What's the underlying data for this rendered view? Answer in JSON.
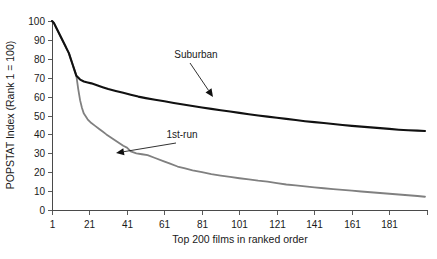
{
  "chart_data": {
    "type": "line",
    "title": "",
    "xlabel": "Top 200 films in ranked order",
    "ylabel": "POPSTAT Index (Rank 1 = 100)",
    "xlim": [
      1,
      200
    ],
    "ylim": [
      0,
      100
    ],
    "grid": false,
    "legend_position": "inline-annotations",
    "xticks": [
      1,
      21,
      41,
      61,
      81,
      101,
      121,
      141,
      161,
      181
    ],
    "xtick_labels": [
      "1",
      "21",
      "41",
      "61",
      "81",
      "101",
      "121",
      "141",
      "161",
      "181"
    ],
    "yticks": [
      0,
      10,
      20,
      30,
      40,
      50,
      60,
      70,
      80,
      90,
      100
    ],
    "ytick_labels": [
      "0",
      "10",
      "20",
      "30",
      "40",
      "50",
      "60",
      "70",
      "80",
      "90",
      "100"
    ],
    "series": [
      {
        "name": "Suburban",
        "color": "#111111",
        "width": 2.1,
        "x": [
          1,
          2,
          3,
          4,
          5,
          6,
          7,
          8,
          9,
          10,
          11,
          12,
          13,
          14,
          16,
          18,
          20,
          22,
          25,
          28,
          31,
          35,
          39,
          43,
          47,
          51,
          56,
          61,
          66,
          71,
          76,
          81,
          86,
          91,
          96,
          101,
          106,
          111,
          116,
          121,
          126,
          131,
          136,
          141,
          146,
          151,
          156,
          161,
          166,
          171,
          176,
          181,
          186,
          191,
          196,
          200
        ],
        "values": [
          100,
          99,
          97,
          95,
          93,
          91,
          89,
          87,
          85,
          83,
          80,
          77,
          74,
          71,
          69,
          68,
          67.5,
          67,
          66,
          65,
          64,
          63,
          62,
          61,
          60,
          59.2,
          58.3,
          57.5,
          56.6,
          55.8,
          55,
          54.2,
          53.5,
          52.8,
          52.1,
          51.4,
          50.7,
          50,
          49.4,
          48.8,
          48.2,
          47.6,
          47,
          46.5,
          46,
          45.5,
          45,
          44.5,
          44.1,
          43.7,
          43.3,
          42.9,
          42.5,
          42.2,
          42,
          41.8
        ]
      },
      {
        "name": "1st-run",
        "color": "#808080",
        "width": 1.8,
        "x": [
          1,
          2,
          3,
          4,
          5,
          6,
          7,
          8,
          9,
          10,
          11,
          12,
          13,
          14,
          15,
          16,
          17,
          18,
          20,
          22,
          24,
          26,
          28,
          30,
          33,
          36,
          39,
          41,
          43,
          46,
          49,
          52,
          56,
          60,
          64,
          68,
          72,
          76,
          81,
          86,
          91,
          96,
          101,
          106,
          111,
          116,
          121,
          126,
          131,
          136,
          141,
          146,
          151,
          156,
          161,
          166,
          171,
          176,
          181,
          186,
          191,
          196,
          200
        ],
        "values": [
          100,
          99,
          97,
          95,
          93,
          91,
          89,
          87,
          85,
          83,
          80,
          77,
          74,
          71,
          64,
          58,
          54,
          51,
          48,
          46,
          44.5,
          43,
          41.5,
          40,
          38,
          36,
          34,
          33,
          31,
          30,
          29.5,
          29,
          27.5,
          26,
          24.5,
          23,
          22,
          21,
          20,
          19,
          18.2,
          17.5,
          16.8,
          16.2,
          15.5,
          15,
          14.2,
          13.5,
          13,
          12.5,
          12,
          11.5,
          11,
          10.6,
          10.2,
          9.8,
          9.4,
          9,
          8.6,
          8.2,
          7.8,
          7.4,
          7
        ]
      }
    ],
    "annotations": [
      {
        "text": "Suburban",
        "label_x": 196,
        "label_y": 58,
        "point_x": 213,
        "point_y": 97,
        "series": "Suburban"
      },
      {
        "text": "1st-run",
        "label_x": 182,
        "label_y": 138,
        "point_x": 116,
        "point_y": 153,
        "series": "1st-run"
      }
    ]
  }
}
